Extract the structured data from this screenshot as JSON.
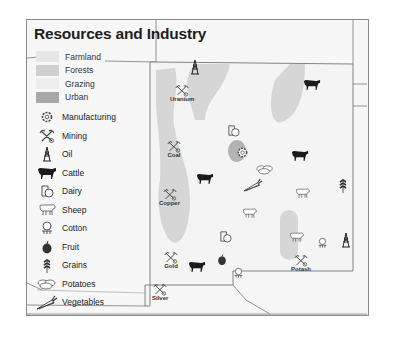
{
  "map": {
    "title": "Resources and Industry"
  },
  "legend": {
    "land_use": [
      {
        "label": "Farmland",
        "color": "#e6e6e6"
      },
      {
        "label": "Forests",
        "color": "#cfcfcf"
      },
      {
        "label": "Grazing",
        "color": "#ededed"
      },
      {
        "label": "Urban",
        "color": "#a8a8a8"
      }
    ],
    "resources": [
      {
        "label": "Manufacturing",
        "icon": "gear-icon"
      },
      {
        "label": "Mining",
        "icon": "pick-axe-icon"
      },
      {
        "label": "Oil",
        "icon": "oil-derrick-icon"
      },
      {
        "label": "Cattle",
        "icon": "cattle-icon"
      },
      {
        "label": "Dairy",
        "icon": "dairy-icon"
      },
      {
        "label": "Sheep",
        "icon": "sheep-icon"
      },
      {
        "label": "Cotton",
        "icon": "cotton-icon"
      },
      {
        "label": "Fruit",
        "icon": "fruit-icon"
      },
      {
        "label": "Grains",
        "icon": "grains-icon"
      },
      {
        "label": "Potatoes",
        "icon": "potatoes-icon"
      },
      {
        "label": "Vegetables",
        "icon": "vegetables-icon"
      }
    ]
  },
  "mining_sites": [
    {
      "label": "Uranium"
    },
    {
      "label": "Coal"
    },
    {
      "label": "Copper"
    },
    {
      "label": "Gold"
    },
    {
      "label": "Silver"
    },
    {
      "label": "Potash"
    }
  ]
}
